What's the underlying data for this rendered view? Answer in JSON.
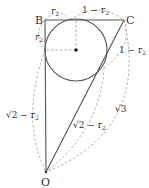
{
  "diagram": {
    "type": "geometry",
    "points": {
      "B": {
        "label": "B",
        "x": 45,
        "y": 20
      },
      "C": {
        "label": "C",
        "x": 124,
        "y": 20
      },
      "O": {
        "label": "O",
        "x": 46,
        "y": 172
      }
    },
    "circle": {
      "cx": 76,
      "cy": 50,
      "r": 31,
      "center_dot": true
    },
    "labels": {
      "b_top_segment": "r",
      "b_top_segment_sub": "2",
      "c_top_segment": "1 − r",
      "c_top_segment_sub": "2",
      "b_left_segment": "r",
      "b_left_segment_sub": "2",
      "c_right_segment": "1 − r",
      "c_right_segment_sub": "2",
      "bo_segment": "√2 − r",
      "bo_segment_sub": "2",
      "co_segment": "√2 − r",
      "co_segment_sub": "2",
      "hypotenuse_arc": "√3"
    },
    "colors": {
      "solid_line": "#555555",
      "dashed_line": "#999999",
      "text": "#333333",
      "background": "#ffffff"
    }
  }
}
